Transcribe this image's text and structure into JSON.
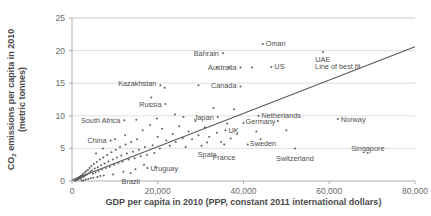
{
  "chart_data": {
    "type": "scatter",
    "title": "",
    "xlabel": "GDP per capita in 2010 (PPP, constant 2011 international dollars)",
    "ylabel_line1": "CO",
    "ylabel_sub": "2",
    "ylabel_line1b": " emissions per capita in 2010",
    "ylabel_line2": "(metric tonnes)",
    "ylabel_full": "CO2 emissions per capita in 2010 (metric tonnes)",
    "xlim": [
      0,
      80000
    ],
    "ylim": [
      0,
      25
    ],
    "xticks": [
      0,
      20000,
      40000,
      60000,
      80000
    ],
    "xtick_labels": [
      "0",
      "20,000",
      "40,000",
      "60,000",
      "80,000"
    ],
    "yticks": [
      0,
      5,
      10,
      15,
      20,
      25
    ],
    "ytick_labels": [
      "0",
      "5",
      "10",
      "15",
      "20",
      "25"
    ],
    "grid": "horizontal",
    "legend": "none",
    "fit_line": {
      "label": "Line of best fit",
      "x_start": 0,
      "y_start": 0.15,
      "x_end": 80000,
      "y_end": 20.6,
      "label_x": 62000,
      "label_y": 17.2
    },
    "labeled_points": [
      {
        "name": "Oman",
        "x": 44500,
        "y": 21.0,
        "label_dx": 3,
        "label_dy": -1
      },
      {
        "name": "Bahrain",
        "x": 35200,
        "y": 19.6,
        "label_dx": -4,
        "label_dy": 0,
        "anchor": "end"
      },
      {
        "name": "UAE",
        "x": 58500,
        "y": 19.8,
        "label_dx": 0,
        "label_dy": 8,
        "anchor": "middle"
      },
      {
        "name": "Australia",
        "x": 39300,
        "y": 17.4,
        "label_dx": -4,
        "label_dy": 0,
        "anchor": "end"
      },
      {
        "name": "US",
        "x": 46500,
        "y": 17.5,
        "label_dx": 3,
        "label_dy": 0
      },
      {
        "name": "Kazakhstan",
        "x": 20600,
        "y": 14.7,
        "label_dx": -4,
        "label_dy": -2,
        "anchor": "end"
      },
      {
        "name": "Canada",
        "x": 39300,
        "y": 14.5,
        "label_dx": -4,
        "label_dy": -1,
        "anchor": "end"
      },
      {
        "name": "Russia",
        "x": 21800,
        "y": 11.8,
        "label_dx": -4,
        "label_dy": 0,
        "anchor": "end"
      },
      {
        "name": "Japan",
        "x": 34000,
        "y": 9.8,
        "label_dx": -4,
        "label_dy": 0,
        "anchor": "end"
      },
      {
        "name": "Netherlands",
        "x": 43500,
        "y": 10.0,
        "label_dx": 3,
        "label_dy": 0
      },
      {
        "name": "Norway",
        "x": 62000,
        "y": 9.5,
        "label_dx": 3,
        "label_dy": 0
      },
      {
        "name": "South Africa",
        "x": 12200,
        "y": 9.3,
        "label_dx": -4,
        "label_dy": 0,
        "anchor": "end"
      },
      {
        "name": "Germany",
        "x": 40000,
        "y": 8.9,
        "label_dx": 2,
        "label_dy": -1
      },
      {
        "name": "UK",
        "x": 35800,
        "y": 7.8,
        "label_dx": 3,
        "label_dy": 0
      },
      {
        "name": "Sweden",
        "x": 41000,
        "y": 5.6,
        "label_dx": 2,
        "label_dy": -1
      },
      {
        "name": "China",
        "x": 9000,
        "y": 6.2,
        "label_dx": -4,
        "label_dy": 0,
        "anchor": "end"
      },
      {
        "name": "Spain",
        "x": 31500,
        "y": 5.9,
        "label_dx": 0,
        "label_dy": 12,
        "anchor": "middle"
      },
      {
        "name": "France",
        "x": 35500,
        "y": 5.6,
        "label_dx": 0,
        "label_dy": 13,
        "anchor": "middle"
      },
      {
        "name": "Switzerland",
        "x": 52000,
        "y": 5.0,
        "label_dx": 0,
        "label_dy": 10,
        "anchor": "middle"
      },
      {
        "name": "Singapore",
        "x": 69000,
        "y": 4.3,
        "label_dx": 0,
        "label_dy": -4,
        "anchor": "middle"
      },
      {
        "name": "Uruguay",
        "x": 17600,
        "y": 2.0,
        "label_dx": 3,
        "label_dy": 1
      },
      {
        "name": "Brazil",
        "x": 13700,
        "y": 1.2,
        "label_dx": 0,
        "label_dy": 8,
        "anchor": "middle"
      }
    ],
    "unlabeled_points": [
      {
        "x": 600,
        "y": 0.05
      },
      {
        "x": 750,
        "y": 0.1
      },
      {
        "x": 900,
        "y": 0.08
      },
      {
        "x": 1000,
        "y": 0.2
      },
      {
        "x": 1100,
        "y": 0.3
      },
      {
        "x": 1200,
        "y": 0.15
      },
      {
        "x": 1300,
        "y": 0.4
      },
      {
        "x": 1400,
        "y": 0.25
      },
      {
        "x": 1500,
        "y": 0.5
      },
      {
        "x": 1600,
        "y": 0.35
      },
      {
        "x": 1700,
        "y": 0.6
      },
      {
        "x": 1800,
        "y": 0.45
      },
      {
        "x": 1900,
        "y": 0.7
      },
      {
        "x": 2000,
        "y": 0.3
      },
      {
        "x": 2100,
        "y": 0.8
      },
      {
        "x": 2200,
        "y": 0.55
      },
      {
        "x": 2400,
        "y": 0.9
      },
      {
        "x": 2500,
        "y": 0.6
      },
      {
        "x": 2600,
        "y": 1.1
      },
      {
        "x": 2800,
        "y": 0.7
      },
      {
        "x": 3000,
        "y": 1.3
      },
      {
        "x": 3100,
        "y": 0.9
      },
      {
        "x": 3300,
        "y": 1.5
      },
      {
        "x": 3500,
        "y": 1.0
      },
      {
        "x": 3700,
        "y": 1.7
      },
      {
        "x": 3900,
        "y": 1.2
      },
      {
        "x": 4100,
        "y": 2.0
      },
      {
        "x": 4300,
        "y": 1.4
      },
      {
        "x": 4500,
        "y": 2.3
      },
      {
        "x": 4700,
        "y": 1.6
      },
      {
        "x": 4900,
        "y": 1.1
      },
      {
        "x": 5100,
        "y": 2.6
      },
      {
        "x": 5300,
        "y": 1.9
      },
      {
        "x": 5500,
        "y": 1.3
      },
      {
        "x": 5800,
        "y": 2.9
      },
      {
        "x": 6000,
        "y": 2.1
      },
      {
        "x": 6200,
        "y": 1.5
      },
      {
        "x": 6500,
        "y": 3.3
      },
      {
        "x": 6800,
        "y": 2.4
      },
      {
        "x": 7000,
        "y": 1.8
      },
      {
        "x": 7300,
        "y": 3.6
      },
      {
        "x": 7600,
        "y": 2.7
      },
      {
        "x": 7900,
        "y": 2.0
      },
      {
        "x": 8200,
        "y": 4.0
      },
      {
        "x": 8500,
        "y": 3.0
      },
      {
        "x": 8800,
        "y": 2.2
      },
      {
        "x": 9200,
        "y": 4.4
      },
      {
        "x": 9500,
        "y": 3.3
      },
      {
        "x": 9800,
        "y": 2.5
      },
      {
        "x": 10200,
        "y": 4.8
      },
      {
        "x": 10500,
        "y": 3.6
      },
      {
        "x": 10800,
        "y": 2.8
      },
      {
        "x": 11200,
        "y": 5.2
      },
      {
        "x": 11500,
        "y": 3.9
      },
      {
        "x": 11800,
        "y": 3.0
      },
      {
        "x": 12500,
        "y": 5.6
      },
      {
        "x": 12800,
        "y": 4.2
      },
      {
        "x": 13200,
        "y": 3.3
      },
      {
        "x": 13800,
        "y": 6.0
      },
      {
        "x": 14200,
        "y": 4.5
      },
      {
        "x": 14600,
        "y": 3.5
      },
      {
        "x": 15200,
        "y": 6.4
      },
      {
        "x": 15600,
        "y": 4.8
      },
      {
        "x": 16000,
        "y": 3.8
      },
      {
        "x": 16500,
        "y": 7.8
      },
      {
        "x": 17000,
        "y": 5.2
      },
      {
        "x": 17500,
        "y": 4.0
      },
      {
        "x": 18200,
        "y": 8.6
      },
      {
        "x": 18800,
        "y": 5.5
      },
      {
        "x": 19200,
        "y": 4.3
      },
      {
        "x": 20000,
        "y": 6.8
      },
      {
        "x": 20500,
        "y": 5.0
      },
      {
        "x": 21000,
        "y": 8.0
      },
      {
        "x": 22000,
        "y": 6.2
      },
      {
        "x": 22800,
        "y": 5.4
      },
      {
        "x": 23500,
        "y": 7.2
      },
      {
        "x": 24200,
        "y": 6.0
      },
      {
        "x": 25000,
        "y": 8.4
      },
      {
        "x": 25800,
        "y": 6.6
      },
      {
        "x": 26500,
        "y": 5.2
      },
      {
        "x": 27200,
        "y": 7.6
      },
      {
        "x": 28000,
        "y": 6.4
      },
      {
        "x": 28800,
        "y": 9.2
      },
      {
        "x": 29500,
        "y": 7.0
      },
      {
        "x": 30200,
        "y": 5.4
      },
      {
        "x": 31000,
        "y": 8.2
      },
      {
        "x": 32000,
        "y": 6.8
      },
      {
        "x": 33000,
        "y": 11.2
      },
      {
        "x": 33800,
        "y": 7.4
      },
      {
        "x": 34800,
        "y": 6.0
      },
      {
        "x": 36200,
        "y": 8.8
      },
      {
        "x": 37000,
        "y": 6.5
      },
      {
        "x": 37800,
        "y": 11.0
      },
      {
        "x": 38500,
        "y": 7.2
      },
      {
        "x": 42000,
        "y": 17.4
      },
      {
        "x": 43000,
        "y": 7.6
      },
      {
        "x": 44000,
        "y": 6.4
      },
      {
        "x": 48000,
        "y": 9.2
      },
      {
        "x": 50000,
        "y": 7.8
      },
      {
        "x": 33800,
        "y": 17.4
      },
      {
        "x": 36600,
        "y": 17.4
      },
      {
        "x": 29500,
        "y": 14.7
      },
      {
        "x": 21600,
        "y": 14.3
      },
      {
        "x": 18500,
        "y": 12.8
      },
      {
        "x": 15000,
        "y": 9.4
      },
      {
        "x": 12400,
        "y": 7.0
      },
      {
        "x": 10000,
        "y": 6.4
      },
      {
        "x": 7200,
        "y": 5.0
      },
      {
        "x": 5600,
        "y": 4.2
      },
      {
        "x": 26000,
        "y": 9.8
      },
      {
        "x": 24000,
        "y": 10.2
      },
      {
        "x": 19800,
        "y": 9.6
      },
      {
        "x": 16800,
        "y": 2.5
      },
      {
        "x": 19500,
        "y": 2.2
      },
      {
        "x": 14800,
        "y": 1.8
      },
      {
        "x": 12000,
        "y": 1.4
      },
      {
        "x": 9600,
        "y": 1.0
      },
      {
        "x": 2300,
        "y": 0.05
      },
      {
        "x": 2700,
        "y": 0.12
      },
      {
        "x": 3200,
        "y": 0.22
      },
      {
        "x": 3800,
        "y": 0.32
      },
      {
        "x": 4400,
        "y": 0.42
      },
      {
        "x": 5000,
        "y": 0.5
      },
      {
        "x": 5900,
        "y": 0.62
      },
      {
        "x": 6600,
        "y": 0.75
      },
      {
        "x": 7400,
        "y": 0.85
      }
    ]
  }
}
